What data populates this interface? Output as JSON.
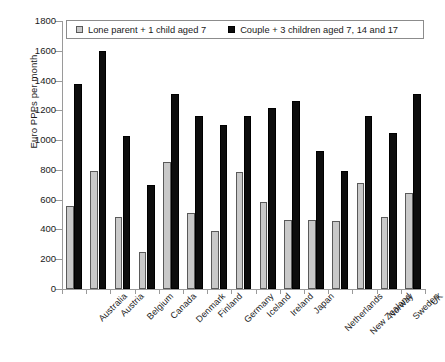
{
  "chart_data": {
    "type": "bar",
    "title": "",
    "xlabel": "",
    "ylabel": "Euro PPPs per month",
    "ylim": [
      0,
      1800
    ],
    "ytick_step": 200,
    "yticks": [
      0,
      200,
      400,
      600,
      800,
      1000,
      1200,
      1400,
      1600,
      1800
    ],
    "grid": false,
    "legend_position": "top-inside",
    "categories": [
      "Australia",
      "Austria",
      "Belgium",
      "Canada",
      "Denmark",
      "Finland",
      "Germany",
      "Iceland",
      "Ireland",
      "Japan",
      "Netherlands",
      "New Zealand",
      "Norway",
      "Sweden",
      "UK"
    ],
    "series": [
      {
        "name": "Lone parent + 1 child aged 7",
        "color": "#c9c9c9",
        "values": [
          555,
          790,
          485,
          250,
          850,
          510,
          390,
          785,
          585,
          465,
          465,
          455,
          715,
          485,
          645
        ]
      },
      {
        "name": "Couple + 3 children aged 7, 14 and 17",
        "color": "#0d0d0d",
        "values": [
          1380,
          1600,
          1030,
          700,
          1310,
          1160,
          1100,
          1160,
          1215,
          1265,
          925,
          790,
          1160,
          1045,
          1310
        ]
      }
    ]
  }
}
